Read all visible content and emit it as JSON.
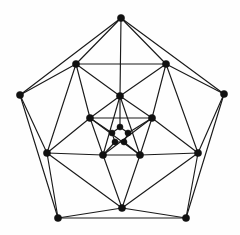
{
  "figure": {
    "kind": "graph-diagram",
    "background_color": "#fefefe",
    "edge_color": "#1a1a1a",
    "vertex_color": "#111111",
    "edge_width": 1.15,
    "vertex_radius": 3.6,
    "vertex_count": 20,
    "edge_count": 50,
    "canvas": {
      "width": 240,
      "height": 235
    }
  },
  "chart_data": {
    "type": "scatter",
    "xlabel": "",
    "ylabel": "",
    "xlim": [
      0,
      240
    ],
    "ylim": [
      0,
      235
    ],
    "grid": false,
    "legend": "none",
    "vertices": [
      {
        "id": 0,
        "label": "A0",
        "ring": "outer",
        "x": 121,
        "y": 18
      },
      {
        "id": 1,
        "label": "A1",
        "ring": "outer",
        "x": 224,
        "y": 94
      },
      {
        "id": 2,
        "label": "A2",
        "ring": "outer",
        "x": 186,
        "y": 218
      },
      {
        "id": 3,
        "label": "A3",
        "ring": "outer",
        "x": 58,
        "y": 218
      },
      {
        "id": 4,
        "label": "A4",
        "ring": "outer",
        "x": 20,
        "y": 95
      },
      {
        "id": 5,
        "label": "B0",
        "ring": "second",
        "x": 166,
        "y": 64
      },
      {
        "id": 6,
        "label": "B1",
        "ring": "second",
        "x": 198,
        "y": 153
      },
      {
        "id": 7,
        "label": "B2",
        "ring": "second",
        "x": 122,
        "y": 208
      },
      {
        "id": 8,
        "label": "B3",
        "ring": "second",
        "x": 47,
        "y": 153
      },
      {
        "id": 9,
        "label": "B4",
        "ring": "second",
        "x": 76,
        "y": 64
      },
      {
        "id": 10,
        "label": "C0",
        "ring": "third",
        "x": 120,
        "y": 96
      },
      {
        "id": 11,
        "label": "C1",
        "ring": "third",
        "x": 152,
        "y": 118
      },
      {
        "id": 12,
        "label": "C2",
        "ring": "third",
        "x": 140,
        "y": 155
      },
      {
        "id": 13,
        "label": "C3",
        "ring": "third",
        "x": 103,
        "y": 155
      },
      {
        "id": 14,
        "label": "C4",
        "ring": "third",
        "x": 90,
        "y": 118
      },
      {
        "id": 15,
        "label": "D0",
        "ring": "inner",
        "x": 120,
        "y": 127
      },
      {
        "id": 16,
        "label": "D1",
        "ring": "inner",
        "x": 128,
        "y": 133
      },
      {
        "id": 17,
        "label": "D2",
        "ring": "inner",
        "x": 124,
        "y": 142
      },
      {
        "id": 18,
        "label": "D3",
        "ring": "inner",
        "x": 115,
        "y": 142
      },
      {
        "id": 19,
        "label": "D4",
        "ring": "inner",
        "x": 112,
        "y": 133
      }
    ],
    "edges": [
      [
        0,
        1
      ],
      [
        1,
        2
      ],
      [
        2,
        3
      ],
      [
        3,
        4
      ],
      [
        4,
        0
      ],
      [
        0,
        5
      ],
      [
        0,
        9
      ],
      [
        1,
        5
      ],
      [
        1,
        6
      ],
      [
        2,
        6
      ],
      [
        2,
        7
      ],
      [
        3,
        7
      ],
      [
        3,
        8
      ],
      [
        4,
        8
      ],
      [
        4,
        9
      ],
      [
        5,
        9
      ],
      [
        5,
        6
      ],
      [
        6,
        7
      ],
      [
        7,
        8
      ],
      [
        8,
        9
      ],
      [
        5,
        10
      ],
      [
        5,
        11
      ],
      [
        9,
        10
      ],
      [
        9,
        14
      ],
      [
        6,
        11
      ],
      [
        6,
        12
      ],
      [
        7,
        12
      ],
      [
        7,
        13
      ],
      [
        8,
        13
      ],
      [
        8,
        14
      ],
      [
        10,
        11
      ],
      [
        11,
        12
      ],
      [
        12,
        13
      ],
      [
        13,
        14
      ],
      [
        14,
        10
      ],
      [
        10,
        12
      ],
      [
        10,
        13
      ],
      [
        11,
        13
      ],
      [
        11,
        14
      ],
      [
        12,
        14
      ],
      [
        10,
        15
      ],
      [
        11,
        16
      ],
      [
        12,
        17
      ],
      [
        13,
        18
      ],
      [
        14,
        19
      ],
      [
        15,
        16
      ],
      [
        16,
        17
      ],
      [
        17,
        18
      ],
      [
        18,
        19
      ],
      [
        19,
        15
      ],
      [
        0,
        10
      ]
    ]
  }
}
